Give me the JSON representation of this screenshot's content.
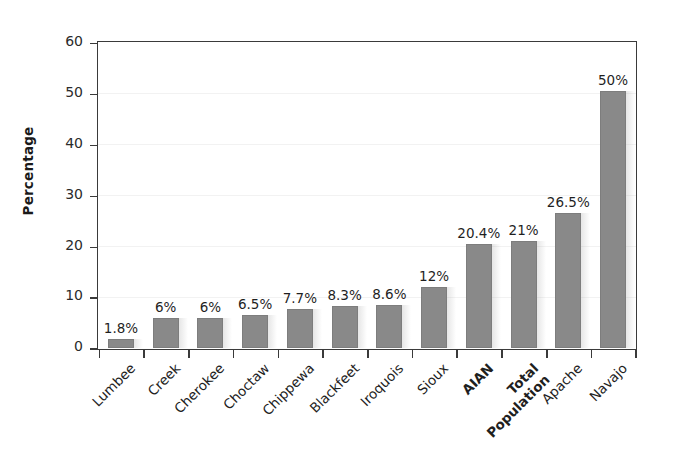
{
  "chart_data": {
    "type": "bar",
    "title": "",
    "xlabel": "",
    "ylabel": "Percentage",
    "ylim": [
      0,
      60
    ],
    "yticks": [
      0,
      10,
      20,
      30,
      40,
      50,
      60
    ],
    "grid": true,
    "legend": "none",
    "bar_color": "#898989",
    "axis_color": "#3a3a3a",
    "categories": [
      "Lumbee",
      "Creek",
      "Cherokee",
      "Choctaw",
      "Chippewa",
      "Blackfeet",
      "Iroquois",
      "Sioux",
      "AIAN",
      "Total Population",
      "Apache",
      "Navajo"
    ],
    "category_emphasis": [
      false,
      false,
      false,
      false,
      false,
      false,
      false,
      false,
      true,
      true,
      false,
      false
    ],
    "values": [
      1.8,
      6,
      6,
      6.5,
      7.7,
      8.3,
      8.6,
      12,
      20.4,
      21,
      26.5,
      50.5
    ],
    "data_labels": [
      "1.8%",
      "6%",
      "6%",
      "6.5%",
      "7.7%",
      "8.3%",
      "8.6%",
      "12%",
      "20.4%",
      "21%",
      "26.5%",
      "50%"
    ]
  }
}
